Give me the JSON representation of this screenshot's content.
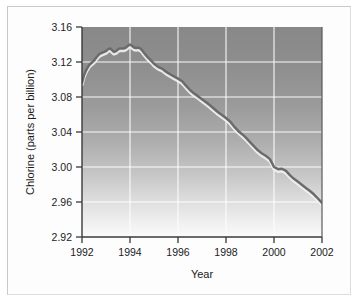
{
  "chart_data": {
    "type": "line",
    "title": "",
    "xlabel": "Year",
    "ylabel": "Chlorine (parts per billion)",
    "xlim": [
      1992,
      2002
    ],
    "ylim": [
      2.92,
      3.16
    ],
    "xticks": [
      "1992",
      "1994",
      "1996",
      "1998",
      "2000",
      "2002"
    ],
    "yticks": [
      "2.92",
      "2.96",
      "3.00",
      "3.04",
      "3.08",
      "3.12",
      "3.16"
    ],
    "xtick_values": [
      1992,
      1994,
      1996,
      1998,
      2000,
      2002
    ],
    "ytick_values": [
      2.92,
      2.96,
      3.0,
      3.04,
      3.08,
      3.12,
      3.16
    ],
    "grid": true,
    "legend": "none",
    "series": [
      {
        "name": "Atmospheric chlorine",
        "color": "#6b6b6b",
        "x": [
          1992.0,
          1992.08,
          1992.17,
          1992.25,
          1992.33,
          1992.42,
          1992.5,
          1992.58,
          1992.67,
          1992.75,
          1992.83,
          1992.92,
          1993.0,
          1993.08,
          1993.17,
          1993.25,
          1993.33,
          1993.42,
          1993.5,
          1993.58,
          1993.67,
          1993.75,
          1993.83,
          1993.92,
          1994.0,
          1994.08,
          1994.17,
          1994.25,
          1994.33,
          1994.42,
          1994.5,
          1994.58,
          1994.67,
          1994.75,
          1994.83,
          1994.92,
          1995.0,
          1995.17,
          1995.33,
          1995.5,
          1995.67,
          1995.83,
          1996.0,
          1996.17,
          1996.33,
          1996.5,
          1996.67,
          1996.83,
          1997.0,
          1997.17,
          1997.33,
          1997.5,
          1997.67,
          1997.83,
          1998.0,
          1998.17,
          1998.33,
          1998.5,
          1998.67,
          1998.83,
          1999.0,
          1999.17,
          1999.33,
          1999.5,
          1999.67,
          1999.83,
          2000.0,
          2000.17,
          2000.33,
          2000.5,
          2000.67,
          2000.83,
          2001.0,
          2001.17,
          2001.33,
          2001.5,
          2001.67,
          2001.83,
          2002.0
        ],
        "y": [
          3.0965,
          3.1045,
          3.1105,
          3.1145,
          3.1175,
          3.1195,
          3.1215,
          3.1245,
          3.1275,
          3.1295,
          3.1305,
          3.1315,
          3.1325,
          3.1345,
          3.1355,
          3.1335,
          3.1315,
          3.1325,
          3.1345,
          3.1355,
          3.1355,
          3.1355,
          3.1365,
          3.1385,
          3.14,
          3.1385,
          3.1365,
          3.136,
          3.1365,
          3.1355,
          3.1335,
          3.1305,
          3.1275,
          3.125,
          3.123,
          3.1205,
          3.118,
          3.1145,
          3.1125,
          3.109,
          3.106,
          3.1035,
          3.101,
          3.098,
          3.093,
          3.088,
          3.084,
          3.081,
          3.0775,
          3.074,
          3.0705,
          3.0665,
          3.0625,
          3.0595,
          3.056,
          3.052,
          3.0465,
          3.0415,
          3.0375,
          3.0335,
          3.0285,
          3.0235,
          3.019,
          3.0155,
          3.0125,
          3.009,
          3.0,
          2.9975,
          2.998,
          2.9955,
          2.9905,
          2.9865,
          2.983,
          2.9795,
          2.976,
          2.9725,
          2.9685,
          2.964,
          2.959
        ]
      }
    ],
    "peak": {
      "year": 1994.0,
      "value": 3.14
    },
    "start": {
      "year": 1992.0,
      "value": 3.0965
    },
    "end": {
      "year": 2002.0,
      "value": 2.948
    },
    "colors": {
      "line": "#6b6b6b",
      "line_highlight": "#f2f2f2",
      "grid": "#ffffff",
      "axis": "#333333",
      "plot_bg_top": "#8d8d8d",
      "plot_bg_bottom": "#fafafa",
      "figure_bg": "#fdfdfd"
    }
  }
}
